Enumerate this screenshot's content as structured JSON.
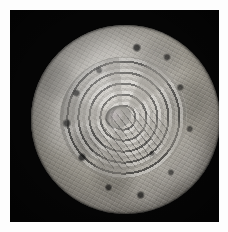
{
  "image": {
    "kind": "astronomical-render",
    "subject_label": "Spherical icy body, polar view",
    "background_color": "#050505",
    "page_margin_color": "#fdfdfd",
    "surface_tone_light": "#d8d4cd",
    "surface_tone_mid": "#9d998f",
    "surface_tone_dark": "#2d2b29",
    "illumination": "from upper left",
    "caption": ""
  },
  "features": {
    "body": {
      "name": "sphere-disc",
      "center_x": 115,
      "center_y": 110,
      "radius": 94
    },
    "basin": {
      "name": "concentric-ring-basin",
      "label": "multi-ring impact basin",
      "ring_count": 7,
      "center_offset_x": -4,
      "center_offset_y": -2
    },
    "floor_patch": {
      "name": "basin-floor",
      "label": "smooth central floor"
    },
    "terminator": {
      "name": "limb-shading",
      "label": "limb darkening toward lower right"
    }
  },
  "annotations": {
    "none_visible": ""
  }
}
